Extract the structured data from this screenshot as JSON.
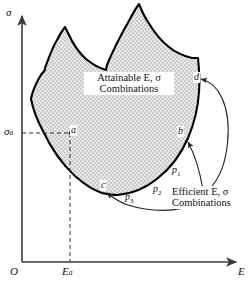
{
  "figure": {
    "type": "economics-diagram",
    "axes": {
      "y_label": "σ",
      "x_label": "E",
      "origin_label": "O",
      "y_tick_label": "σ",
      "y_tick_sub": "a",
      "x_tick_label": "E",
      "x_tick_sub": "a"
    },
    "region_caption": {
      "line1": "Attainable E, σ",
      "line2": "Combinations"
    },
    "efficient_caption": {
      "line1": "Efficient E, σ",
      "line2": "Combinations"
    },
    "points": [
      {
        "id": "point-a",
        "label": "a"
      },
      {
        "id": "point-b",
        "label": "b"
      },
      {
        "id": "point-c",
        "label": "c"
      },
      {
        "id": "point-d",
        "label": "d"
      }
    ],
    "portfolios": [
      {
        "id": "portfolio-p1",
        "label": "p",
        "sub": "1"
      },
      {
        "id": "portfolio-p2",
        "label": "p",
        "sub": "2"
      },
      {
        "id": "portfolio-p3",
        "label": "p",
        "sub": "3"
      }
    ],
    "colors": {
      "fill": "#d9d9d9",
      "stroke": "#000000",
      "axis": "#3a3a3a",
      "background": "#ffffff"
    }
  }
}
